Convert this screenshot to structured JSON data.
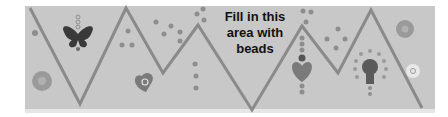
{
  "worksheet": {
    "instruction_line1": "Fill in this",
    "instruction_line2": "area with",
    "instruction_line3": "beads",
    "colors": {
      "band": "#c8c8c8",
      "zigzag": "#8a8a8a",
      "dots": "#8e8e8e",
      "butterfly": "#3a3a3a",
      "flower": "#9a9a9a",
      "heart": "#7a7a7a",
      "text": "#111111"
    },
    "decorations": [
      "butterfly-icon",
      "flower-icon",
      "heart-icon",
      "bead-dots",
      "light-bulb-icon",
      "flower-icon-small"
    ]
  }
}
